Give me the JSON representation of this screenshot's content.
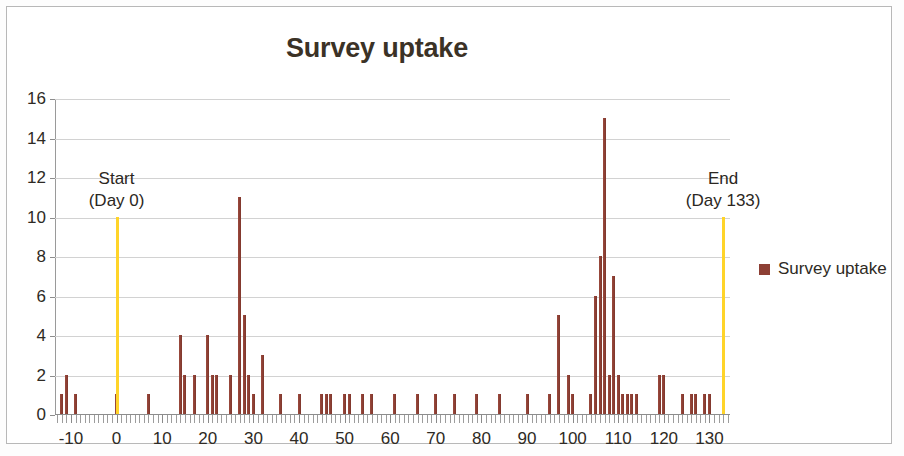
{
  "chart_data": {
    "type": "bar",
    "title": "Survey uptake",
    "xlabel": "",
    "ylabel": "",
    "xlim": [
      -13.5,
      134.5
    ],
    "ylim": [
      0,
      16
    ],
    "ytick_step": 2,
    "yticks": [
      0,
      2,
      4,
      6,
      8,
      10,
      12,
      14,
      16
    ],
    "xticks_labeled": [
      -10,
      0,
      10,
      20,
      30,
      40,
      50,
      60,
      70,
      80,
      90,
      100,
      110,
      120,
      130
    ],
    "xtick_minor_step": 1,
    "grid": "horizontal",
    "legend_position": "right",
    "series": [
      {
        "name": "Survey uptake",
        "color": "#8d3f34",
        "x": [
          -12,
          -11,
          -9,
          0,
          7,
          14,
          15,
          17,
          20,
          21,
          22,
          25,
          27,
          28,
          29,
          30,
          32,
          36,
          40,
          45,
          46,
          47,
          50,
          51,
          54,
          56,
          61,
          66,
          70,
          74,
          79,
          84,
          90,
          95,
          97,
          99,
          100,
          104,
          105,
          106,
          107,
          108,
          109,
          110,
          111,
          112,
          113,
          114,
          119,
          120,
          124,
          126,
          127,
          129,
          130,
          133
        ],
        "values": [
          1,
          2,
          1,
          1,
          1,
          4,
          2,
          2,
          4,
          2,
          2,
          2,
          11,
          5,
          2,
          1,
          3,
          1,
          1,
          1,
          1,
          1,
          1,
          1,
          1,
          1,
          1,
          1,
          1,
          1,
          1,
          1,
          1,
          1,
          5,
          2,
          1,
          1,
          6,
          8,
          15,
          2,
          7,
          2,
          1,
          1,
          1,
          1,
          2,
          2,
          1,
          1,
          1,
          1,
          1,
          1
        ]
      }
    ],
    "annotations": [
      {
        "name": "start-marker",
        "label_line1": "Start",
        "label_line2": "(Day 0)",
        "x": 0,
        "color": "#ffd429",
        "y_top": 10
      },
      {
        "name": "end-marker",
        "label_line1": "End",
        "label_line2": "(Day 133)",
        "x": 133,
        "color": "#ffd429",
        "y_top": 10
      }
    ]
  },
  "legend": {
    "items": [
      {
        "label": "Survey uptake",
        "color": "#8d3f34"
      }
    ]
  }
}
